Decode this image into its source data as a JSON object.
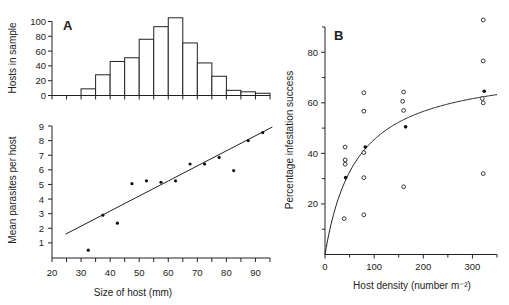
{
  "chart_data": [
    {
      "id": "A_hist",
      "type": "bar",
      "panel_label": "A",
      "title": "",
      "xlabel": "",
      "ylabel": "Hosts in sample",
      "xlim": [
        20,
        95
      ],
      "ylim": [
        0,
        100
      ],
      "yticks": [
        0,
        20,
        40,
        60,
        80,
        100
      ],
      "bin_width": 5,
      "bins": [
        {
          "start": 30,
          "end": 35,
          "value": 9
        },
        {
          "start": 35,
          "end": 40,
          "value": 28
        },
        {
          "start": 40,
          "end": 45,
          "value": 46
        },
        {
          "start": 45,
          "end": 50,
          "value": 51
        },
        {
          "start": 50,
          "end": 55,
          "value": 76
        },
        {
          "start": 55,
          "end": 60,
          "value": 93
        },
        {
          "start": 60,
          "end": 65,
          "value": 105
        },
        {
          "start": 65,
          "end": 70,
          "value": 71
        },
        {
          "start": 70,
          "end": 75,
          "value": 44
        },
        {
          "start": 75,
          "end": 80,
          "value": 26
        },
        {
          "start": 80,
          "end": 85,
          "value": 7
        },
        {
          "start": 85,
          "end": 90,
          "value": 5
        },
        {
          "start": 90,
          "end": 95,
          "value": 3
        }
      ],
      "grid": false
    },
    {
      "id": "A_scatter",
      "type": "scatter",
      "title": "",
      "xlabel": "Size of host (mm)",
      "ylabel": "Mean parasites per host",
      "xlim": [
        20,
        95
      ],
      "ylim": [
        0,
        9
      ],
      "xticks": [
        20,
        30,
        40,
        50,
        60,
        70,
        80,
        90
      ],
      "yticks": [
        1,
        2,
        3,
        4,
        5,
        6,
        7,
        8,
        9
      ],
      "points": [
        {
          "x": 32.5,
          "y": 0.5
        },
        {
          "x": 37.5,
          "y": 2.9
        },
        {
          "x": 42.5,
          "y": 2.35
        },
        {
          "x": 47.5,
          "y": 5.05
        },
        {
          "x": 52.5,
          "y": 5.25
        },
        {
          "x": 57.5,
          "y": 5.15
        },
        {
          "x": 62.5,
          "y": 5.25
        },
        {
          "x": 67.5,
          "y": 6.4
        },
        {
          "x": 72.5,
          "y": 6.4
        },
        {
          "x": 77.5,
          "y": 6.85
        },
        {
          "x": 82.5,
          "y": 5.95
        },
        {
          "x": 87.5,
          "y": 8.0
        },
        {
          "x": 92.5,
          "y": 8.55
        }
      ],
      "fit_line": {
        "x": [
          24.7,
          95.8
        ],
        "y": [
          1.6,
          8.93
        ]
      },
      "grid": false
    },
    {
      "id": "B",
      "type": "scatter",
      "panel_label": "B",
      "title": "",
      "xlabel": "Host density (number m⁻²)",
      "ylabel": "Percentage infestation success",
      "xlim": [
        0,
        350
      ],
      "ylim": [
        0,
        90
      ],
      "xticks": [
        0,
        100,
        200,
        300
      ],
      "xminor": [
        50,
        150,
        250,
        350
      ],
      "yticks": [
        20,
        40,
        60,
        80
      ],
      "yminor": [
        10,
        30,
        50,
        70,
        90
      ],
      "series": [
        {
          "name": "open",
          "marker": "open-circle",
          "points": [
            {
              "x": 41,
              "y": 42.5
            },
            {
              "x": 41,
              "y": 37.4
            },
            {
              "x": 41,
              "y": 35.7
            },
            {
              "x": 39,
              "y": 14.2
            },
            {
              "x": 79,
              "y": 64
            },
            {
              "x": 79,
              "y": 56.7
            },
            {
              "x": 79,
              "y": 40.3
            },
            {
              "x": 79,
              "y": 30.4
            },
            {
              "x": 79,
              "y": 15.7
            },
            {
              "x": 160,
              "y": 64.3
            },
            {
              "x": 158,
              "y": 60.6
            },
            {
              "x": 160,
              "y": 57
            },
            {
              "x": 160,
              "y": 26.8
            },
            {
              "x": 322,
              "y": 92.8
            },
            {
              "x": 322,
              "y": 76.6
            },
            {
              "x": 320,
              "y": 61.7
            },
            {
              "x": 322,
              "y": 60
            },
            {
              "x": 322,
              "y": 32
            }
          ]
        },
        {
          "name": "filled",
          "marker": "filled-circle",
          "points": [
            {
              "x": 42,
              "y": 30.4
            },
            {
              "x": 82,
              "y": 42.5
            },
            {
              "x": 164,
              "y": 50.5
            },
            {
              "x": 324,
              "y": 64.6
            }
          ]
        }
      ],
      "fit_curve": {
        "form": "y = a*x/(b+x)",
        "a": 75,
        "b": 65
      },
      "grid": false
    }
  ]
}
